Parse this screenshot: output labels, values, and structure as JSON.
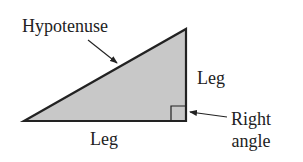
{
  "diagram": {
    "labels": {
      "hypotenuse": "Hypotenuse",
      "leg_vertical": "Leg",
      "leg_horizontal": "Leg",
      "right_angle_line1": "Right",
      "right_angle_line2": "angle"
    },
    "colors": {
      "fill": "#c8c8c8",
      "stroke": "#222222",
      "text": "#222222"
    },
    "triangle": {
      "vertices": [
        [
          24,
          121
        ],
        [
          186,
          29
        ],
        [
          186,
          121
        ]
      ]
    }
  }
}
